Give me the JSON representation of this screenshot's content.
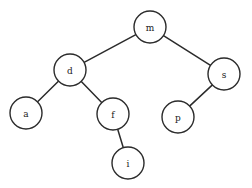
{
  "diagram": {
    "type": "binary-search-tree",
    "background_color": "#ffffff",
    "node_fill_color": "#ffffff",
    "node_stroke_color": "#2b2b2b",
    "edge_color": "#2b2b2b",
    "node_radius": 16,
    "nodes": [
      {
        "id": "m",
        "label": "m",
        "cx": 150,
        "cy": 27,
        "r": 16,
        "role": "root"
      },
      {
        "id": "d",
        "label": "d",
        "cx": 70,
        "cy": 70,
        "r": 16,
        "role": "left-child-of-m"
      },
      {
        "id": "s",
        "label": "s",
        "cx": 224,
        "cy": 74,
        "r": 16,
        "role": "right-child-of-m"
      },
      {
        "id": "a",
        "label": "a",
        "cx": 26,
        "cy": 113,
        "r": 16,
        "role": "left-child-of-d"
      },
      {
        "id": "f",
        "label": "f",
        "cx": 113,
        "cy": 114,
        "r": 16,
        "role": "right-child-of-d"
      },
      {
        "id": "p",
        "label": "p",
        "cx": 178,
        "cy": 117,
        "r": 16,
        "role": "left-child-of-s"
      },
      {
        "id": "i",
        "label": "i",
        "cx": 128,
        "cy": 163,
        "r": 16,
        "role": "right-child-of-f"
      }
    ],
    "edges": [
      {
        "from": "m",
        "to": "d",
        "label": ""
      },
      {
        "from": "m",
        "to": "s",
        "label": ""
      },
      {
        "from": "d",
        "to": "a",
        "label": ""
      },
      {
        "from": "d",
        "to": "f",
        "label": ""
      },
      {
        "from": "s",
        "to": "p",
        "label": ""
      },
      {
        "from": "f",
        "to": "i",
        "label": ""
      }
    ]
  }
}
